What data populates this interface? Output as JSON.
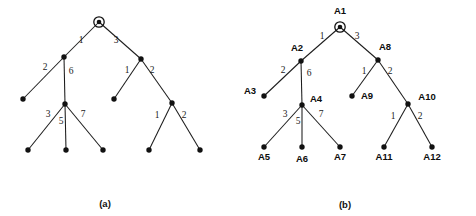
{
  "figure": {
    "background_color": "#ffffff",
    "ink_color": "#111111",
    "panels": [
      {
        "id": "panel-a",
        "caption": "(a)",
        "caption_pos": {
          "x": 105,
          "y": 207
        },
        "labels_shown": false,
        "root_marker": "circled-node",
        "nodes": [
          {
            "id": "a-n1",
            "name": "",
            "x": 99,
            "y": 22,
            "root": true,
            "label_pos": null
          },
          {
            "id": "a-n2",
            "name": "",
            "x": 64,
            "y": 57,
            "root": false,
            "label_pos": null
          },
          {
            "id": "a-n3",
            "name": "",
            "x": 23,
            "y": 99,
            "root": false,
            "label_pos": null
          },
          {
            "id": "a-n4",
            "name": "",
            "x": 65,
            "y": 104,
            "root": false,
            "label_pos": null
          },
          {
            "id": "a-n5",
            "name": "",
            "x": 28,
            "y": 150,
            "root": false,
            "label_pos": null
          },
          {
            "id": "a-n6",
            "name": "",
            "x": 66,
            "y": 150,
            "root": false,
            "label_pos": null
          },
          {
            "id": "a-n7",
            "name": "",
            "x": 103,
            "y": 150,
            "root": false,
            "label_pos": null
          },
          {
            "id": "a-n8",
            "name": "",
            "x": 141,
            "y": 59,
            "root": false,
            "label_pos": null
          },
          {
            "id": "a-n9",
            "name": "",
            "x": 114,
            "y": 99,
            "root": false,
            "label_pos": null
          },
          {
            "id": "a-n10",
            "name": "",
            "x": 172,
            "y": 103,
            "root": false,
            "label_pos": null
          },
          {
            "id": "a-n11",
            "name": "",
            "x": 149,
            "y": 150,
            "root": false,
            "label_pos": null
          },
          {
            "id": "a-n12",
            "name": "",
            "x": 200,
            "y": 150,
            "root": false,
            "label_pos": null
          }
        ],
        "edges": [
          {
            "from": "a-n1",
            "to": "a-n2",
            "weight": "1",
            "label_pos": {
              "x": 81,
              "y": 43
            }
          },
          {
            "from": "a-n1",
            "to": "a-n8",
            "weight": "3",
            "label_pos": {
              "x": 116,
              "y": 43
            }
          },
          {
            "from": "a-n2",
            "to": "a-n3",
            "weight": "2",
            "label_pos": {
              "x": 45,
              "y": 70
            }
          },
          {
            "from": "a-n2",
            "to": "a-n4",
            "weight": "6",
            "label_pos": {
              "x": 71,
              "y": 74
            }
          },
          {
            "from": "a-n4",
            "to": "a-n5",
            "weight": "3",
            "label_pos": {
              "x": 48,
              "y": 117
            }
          },
          {
            "from": "a-n4",
            "to": "a-n6",
            "weight": "5",
            "label_pos": {
              "x": 61,
              "y": 124
            }
          },
          {
            "from": "a-n4",
            "to": "a-n7",
            "weight": "7",
            "label_pos": {
              "x": 83,
              "y": 117
            }
          },
          {
            "from": "a-n8",
            "to": "a-n9",
            "weight": "1",
            "label_pos": {
              "x": 127,
              "y": 73
            }
          },
          {
            "from": "a-n8",
            "to": "a-n10",
            "weight": "2",
            "label_pos": {
              "x": 152,
              "y": 73
            }
          },
          {
            "from": "a-n10",
            "to": "a-n11",
            "weight": "1",
            "label_pos": {
              "x": 157,
              "y": 118
            }
          },
          {
            "from": "a-n10",
            "to": "a-n12",
            "weight": "2",
            "label_pos": {
              "x": 184,
              "y": 118
            }
          }
        ]
      },
      {
        "id": "panel-b",
        "caption": "(b)",
        "caption_pos": {
          "x": 345,
          "y": 208
        },
        "labels_shown": true,
        "root_marker": "circled-node",
        "nodes": [
          {
            "id": "b-n1",
            "name": "A1",
            "x": 340,
            "y": 27,
            "root": true,
            "label_pos": {
              "x": 340,
              "y": 14
            }
          },
          {
            "id": "b-n2",
            "name": "A2",
            "x": 301,
            "y": 61,
            "root": false,
            "label_pos": {
              "x": 297,
              "y": 51
            }
          },
          {
            "id": "b-n3",
            "name": "A3",
            "x": 264,
            "y": 96,
            "root": false,
            "label_pos": {
              "x": 250,
              "y": 94
            }
          },
          {
            "id": "b-n4",
            "name": "A4",
            "x": 302,
            "y": 105,
            "root": false,
            "label_pos": {
              "x": 316,
              "y": 102
            }
          },
          {
            "id": "b-n5",
            "name": "A5",
            "x": 264,
            "y": 147,
            "root": false,
            "label_pos": {
              "x": 264,
              "y": 160
            }
          },
          {
            "id": "b-n6",
            "name": "A6",
            "x": 302,
            "y": 147,
            "root": false,
            "label_pos": {
              "x": 302,
              "y": 162
            }
          },
          {
            "id": "b-n7",
            "name": "A7",
            "x": 340,
            "y": 147,
            "root": false,
            "label_pos": {
              "x": 340,
              "y": 160
            }
          },
          {
            "id": "b-n8",
            "name": "A8",
            "x": 378,
            "y": 60,
            "root": false,
            "label_pos": {
              "x": 385,
              "y": 50
            }
          },
          {
            "id": "b-n9",
            "name": "A9",
            "x": 352,
            "y": 96,
            "root": false,
            "label_pos": {
              "x": 367,
              "y": 99
            }
          },
          {
            "id": "b-n10",
            "name": "A10",
            "x": 408,
            "y": 104,
            "root": false,
            "label_pos": {
              "x": 427,
              "y": 100
            }
          },
          {
            "id": "b-n11",
            "name": "A11",
            "x": 384,
            "y": 147,
            "root": false,
            "label_pos": {
              "x": 384,
              "y": 160
            }
          },
          {
            "id": "b-n12",
            "name": "A12",
            "x": 432,
            "y": 147,
            "root": false,
            "label_pos": {
              "x": 432,
              "y": 160
            }
          }
        ],
        "edges": [
          {
            "from": "b-n1",
            "to": "b-n2",
            "weight": "1",
            "label_pos": {
              "x": 322,
              "y": 39
            }
          },
          {
            "from": "b-n1",
            "to": "b-n8",
            "weight": "3",
            "label_pos": {
              "x": 357,
              "y": 39
            }
          },
          {
            "from": "b-n2",
            "to": "b-n3",
            "weight": "2",
            "label_pos": {
              "x": 283,
              "y": 73
            }
          },
          {
            "from": "b-n2",
            "to": "b-n4",
            "weight": "6",
            "label_pos": {
              "x": 309,
              "y": 76
            }
          },
          {
            "from": "b-n4",
            "to": "b-n5",
            "weight": "3",
            "label_pos": {
              "x": 285,
              "y": 117
            }
          },
          {
            "from": "b-n4",
            "to": "b-n6",
            "weight": "5",
            "label_pos": {
              "x": 298,
              "y": 124
            }
          },
          {
            "from": "b-n4",
            "to": "b-n7",
            "weight": "7",
            "label_pos": {
              "x": 321,
              "y": 117
            }
          },
          {
            "from": "b-n8",
            "to": "b-n9",
            "weight": "1",
            "label_pos": {
              "x": 364,
              "y": 74
            }
          },
          {
            "from": "b-n8",
            "to": "b-n10",
            "weight": "2",
            "label_pos": {
              "x": 390,
              "y": 74
            }
          },
          {
            "from": "b-n10",
            "to": "b-n11",
            "weight": "1",
            "label_pos": {
              "x": 393,
              "y": 119
            }
          },
          {
            "from": "b-n10",
            "to": "b-n12",
            "weight": "2",
            "label_pos": {
              "x": 420,
              "y": 119
            }
          }
        ]
      }
    ]
  }
}
